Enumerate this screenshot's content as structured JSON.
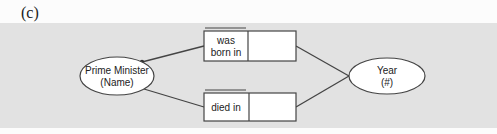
{
  "figure": {
    "label": "(c)"
  },
  "diagram": {
    "type": "object-role-model",
    "colors": {
      "panel_background": "#e2e2e2",
      "stroke": "#444444",
      "node_fill": "#ffffff",
      "text": "#222222"
    },
    "entities": [
      {
        "id": "prime_minister",
        "line1": "Prime Minister",
        "line2": "(Name)"
      },
      {
        "id": "year",
        "line1": "Year",
        "line2": "(#)"
      }
    ],
    "fact_types": [
      {
        "id": "born",
        "role_label_line1": "was",
        "role_label_line2": "born in",
        "from": "prime_minister",
        "to": "year"
      },
      {
        "id": "died",
        "role_label_line1": "died in",
        "role_label_line2": "",
        "from": "prime_minister",
        "to": "year"
      }
    ]
  }
}
